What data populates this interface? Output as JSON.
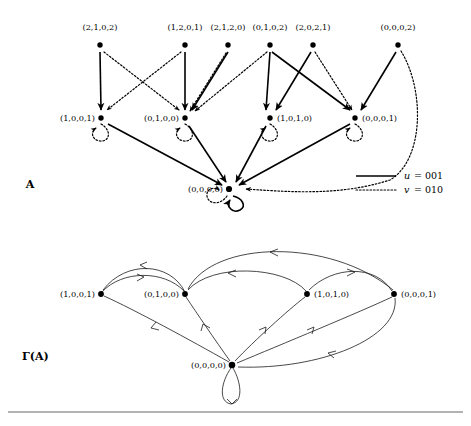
{
  "figure": {
    "panels": [
      {
        "id": "panel-A",
        "label": "A",
        "label_x": 30,
        "label_y": 188
      },
      {
        "id": "panel-gamma-A",
        "label": "Γ(A)",
        "label_x": 22,
        "label_y": 360
      }
    ]
  },
  "diagram_A": {
    "title": "A",
    "top_row": [
      {
        "label": "(2,1,0,2)",
        "x": 100,
        "y": 45,
        "label_x": 100,
        "label_y": 30,
        "anchor": "middle"
      },
      {
        "label": "(1,2,0,1)",
        "x": 185,
        "y": 45,
        "label_x": 185,
        "label_y": 30,
        "anchor": "middle"
      },
      {
        "label": "(2,1,2,0)",
        "x": 228,
        "y": 45,
        "label_x": 228,
        "label_y": 30,
        "anchor": "middle"
      },
      {
        "label": "(0,1,0,2)",
        "x": 270,
        "y": 45,
        "label_x": 270,
        "label_y": 30,
        "anchor": "middle"
      },
      {
        "label": "(2,0,2,1)",
        "x": 313,
        "y": 45,
        "label_x": 313,
        "label_y": 30,
        "anchor": "middle"
      },
      {
        "label": "(0,0,0,2)",
        "x": 398,
        "y": 45,
        "label_x": 398,
        "label_y": 30,
        "anchor": "middle"
      }
    ],
    "middle_row": [
      {
        "label": "(1,0,0,1)",
        "x": 101,
        "y": 118,
        "label_x": 95,
        "label_y": 121,
        "anchor": "end"
      },
      {
        "label": "(0,1,0,0)",
        "x": 185,
        "y": 118,
        "label_x": 179,
        "label_y": 121,
        "anchor": "end"
      },
      {
        "label": "(1,0,1,0)",
        "x": 270,
        "y": 118,
        "label_x": 277,
        "label_y": 121,
        "anchor": "start"
      },
      {
        "label": "(0,0,0,1)",
        "x": 355,
        "y": 118,
        "label_x": 362,
        "label_y": 121,
        "anchor": "start"
      }
    ],
    "bottom_row": [
      {
        "label": "(0,0,0,0)",
        "x": 229,
        "y": 189,
        "label_x": 223,
        "label_y": 192,
        "anchor": "end"
      }
    ],
    "legend": {
      "entries": [
        {
          "style": "solid",
          "var": "u",
          "eq": "=",
          "value": "001"
        },
        {
          "style": "dotted",
          "var": "v",
          "eq": "=",
          "value": "010"
        }
      ]
    }
  },
  "diagram_gamma": {
    "title": "Γ(A)",
    "nodes": [
      {
        "label": "(1,0,0,1)",
        "x": 101,
        "y": 294,
        "label_x": 95,
        "label_y": 297,
        "anchor": "end"
      },
      {
        "label": "(0,1,0,0)",
        "x": 185,
        "y": 294,
        "label_x": 179,
        "label_y": 297,
        "anchor": "end"
      },
      {
        "label": "(1,0,1,0)",
        "x": 307,
        "y": 294,
        "label_x": 314,
        "label_y": 297,
        "anchor": "start"
      },
      {
        "label": "(0,0,0,1)",
        "x": 394,
        "y": 294,
        "label_x": 401,
        "label_y": 297,
        "anchor": "start"
      },
      {
        "label": "(0,0,0,0)",
        "x": 232,
        "y": 365,
        "label_x": 226,
        "label_y": 368,
        "anchor": "end"
      }
    ]
  },
  "colors": {
    "ink": "#000000",
    "rule": "#555555",
    "background": "#ffffff"
  }
}
